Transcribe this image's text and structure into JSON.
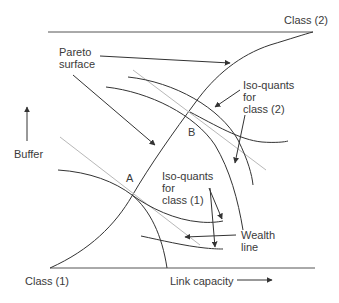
{
  "diagram": {
    "labels": {
      "class2": "Class (2)",
      "class1": "Class (1)",
      "pareto_line1": "Pareto",
      "pareto_line2": "surface",
      "iso2_line1": "Iso-quants",
      "iso2_line2": "for",
      "iso2_line3": "class (2)",
      "iso1_line1": "Iso-quants",
      "iso1_line2": "for",
      "iso1_line3": "class (1)",
      "wealth_line1": "Wealth",
      "wealth_line2": "line",
      "buffer": "Buffer",
      "link_capacity": "Link capacity",
      "point_a": "A",
      "point_b": "B"
    },
    "axes": {
      "vertical": "Buffer",
      "horizontal": "Link capacity"
    },
    "colors": {
      "line": "#333333",
      "wealth_line": "#b0b0b0",
      "text": "#3a3a3a"
    }
  }
}
